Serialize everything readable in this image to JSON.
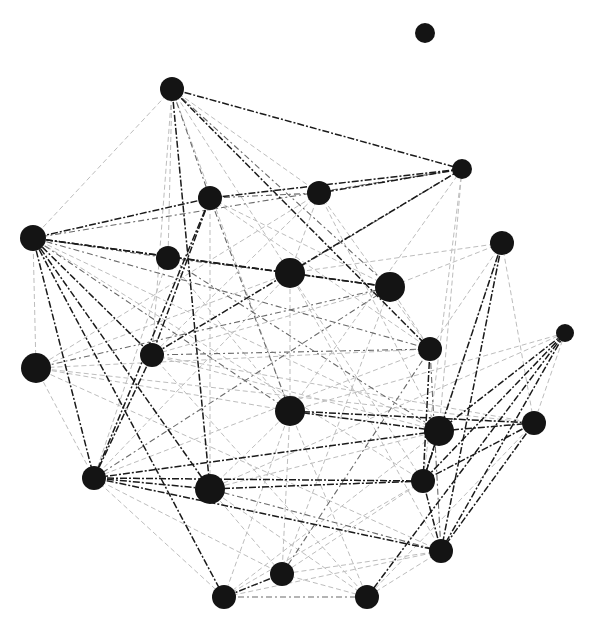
{
  "diagram": {
    "type": "network-graph",
    "background": "#ffffff",
    "node_color": "#141414",
    "edge_colors": {
      "strong": "#1a1a1a",
      "medium": "#6a6a6a",
      "light": "#bdbdbd"
    },
    "nodes": [
      {
        "id": 0,
        "x": 425,
        "y": 33,
        "r": 10
      },
      {
        "id": 1,
        "x": 172,
        "y": 89,
        "r": 12
      },
      {
        "id": 2,
        "x": 462,
        "y": 169,
        "r": 10
      },
      {
        "id": 3,
        "x": 210,
        "y": 198,
        "r": 12
      },
      {
        "id": 4,
        "x": 319,
        "y": 193,
        "r": 12
      },
      {
        "id": 5,
        "x": 33,
        "y": 238,
        "r": 13
      },
      {
        "id": 6,
        "x": 502,
        "y": 243,
        "r": 12
      },
      {
        "id": 7,
        "x": 168,
        "y": 258,
        "r": 12
      },
      {
        "id": 8,
        "x": 290,
        "y": 273,
        "r": 15
      },
      {
        "id": 9,
        "x": 390,
        "y": 287,
        "r": 15
      },
      {
        "id": 10,
        "x": 565,
        "y": 333,
        "r": 9
      },
      {
        "id": 11,
        "x": 430,
        "y": 349,
        "r": 12
      },
      {
        "id": 12,
        "x": 152,
        "y": 355,
        "r": 12
      },
      {
        "id": 13,
        "x": 36,
        "y": 368,
        "r": 15
      },
      {
        "id": 14,
        "x": 290,
        "y": 411,
        "r": 15
      },
      {
        "id": 15,
        "x": 439,
        "y": 431,
        "r": 15
      },
      {
        "id": 16,
        "x": 534,
        "y": 423,
        "r": 12
      },
      {
        "id": 17,
        "x": 94,
        "y": 478,
        "r": 12
      },
      {
        "id": 18,
        "x": 210,
        "y": 489,
        "r": 15
      },
      {
        "id": 19,
        "x": 423,
        "y": 481,
        "r": 12
      },
      {
        "id": 20,
        "x": 441,
        "y": 551,
        "r": 12
      },
      {
        "id": 21,
        "x": 282,
        "y": 574,
        "r": 12
      },
      {
        "id": 22,
        "x": 224,
        "y": 597,
        "r": 12
      },
      {
        "id": 23,
        "x": 367,
        "y": 597,
        "r": 12
      }
    ],
    "edges": [
      {
        "s": 1,
        "t": 2,
        "w": "strong"
      },
      {
        "s": 1,
        "t": 3,
        "w": "medium"
      },
      {
        "s": 1,
        "t": 18,
        "w": "strong"
      },
      {
        "s": 1,
        "t": 11,
        "w": "strong"
      },
      {
        "s": 1,
        "t": 9,
        "w": "medium"
      },
      {
        "s": 1,
        "t": 5,
        "w": "light"
      },
      {
        "s": 1,
        "t": 12,
        "w": "light"
      },
      {
        "s": 1,
        "t": 4,
        "w": "light"
      },
      {
        "s": 1,
        "t": 8,
        "w": "light"
      },
      {
        "s": 1,
        "t": 14,
        "w": "light"
      },
      {
        "s": 1,
        "t": 7,
        "w": "light"
      },
      {
        "s": 2,
        "t": 3,
        "w": "strong"
      },
      {
        "s": 2,
        "t": 4,
        "w": "strong"
      },
      {
        "s": 2,
        "t": 12,
        "w": "strong"
      },
      {
        "s": 2,
        "t": 8,
        "w": "medium"
      },
      {
        "s": 2,
        "t": 5,
        "w": "medium"
      },
      {
        "s": 2,
        "t": 14,
        "w": "light"
      },
      {
        "s": 2,
        "t": 15,
        "w": "light"
      },
      {
        "s": 2,
        "t": 19,
        "w": "light"
      },
      {
        "s": 3,
        "t": 5,
        "w": "strong"
      },
      {
        "s": 3,
        "t": 17,
        "w": "strong"
      },
      {
        "s": 3,
        "t": 14,
        "w": "medium"
      },
      {
        "s": 3,
        "t": 11,
        "w": "light"
      },
      {
        "s": 3,
        "t": 18,
        "w": "light"
      },
      {
        "s": 3,
        "t": 4,
        "w": "medium"
      },
      {
        "s": 3,
        "t": 9,
        "w": "light"
      },
      {
        "s": 4,
        "t": 12,
        "w": "light"
      },
      {
        "s": 4,
        "t": 11,
        "w": "light"
      },
      {
        "s": 4,
        "t": 15,
        "w": "light"
      },
      {
        "s": 4,
        "t": 13,
        "w": "light"
      },
      {
        "s": 5,
        "t": 8,
        "w": "strong"
      },
      {
        "s": 5,
        "t": 9,
        "w": "strong"
      },
      {
        "s": 5,
        "t": 11,
        "w": "medium"
      },
      {
        "s": 5,
        "t": 12,
        "w": "strong"
      },
      {
        "s": 5,
        "t": 17,
        "w": "strong"
      },
      {
        "s": 5,
        "t": 18,
        "w": "strong"
      },
      {
        "s": 5,
        "t": 22,
        "w": "strong"
      },
      {
        "s": 5,
        "t": 14,
        "w": "medium"
      },
      {
        "s": 5,
        "t": 15,
        "w": "light"
      },
      {
        "s": 5,
        "t": 13,
        "w": "light"
      },
      {
        "s": 5,
        "t": 7,
        "w": "medium"
      },
      {
        "s": 5,
        "t": 19,
        "w": "light"
      },
      {
        "s": 6,
        "t": 19,
        "w": "strong"
      },
      {
        "s": 6,
        "t": 20,
        "w": "strong"
      },
      {
        "s": 6,
        "t": 15,
        "w": "light"
      },
      {
        "s": 6,
        "t": 16,
        "w": "light"
      },
      {
        "s": 6,
        "t": 11,
        "w": "light"
      },
      {
        "s": 6,
        "t": 8,
        "w": "light"
      },
      {
        "s": 6,
        "t": 9,
        "w": "light"
      },
      {
        "s": 7,
        "t": 8,
        "w": "medium"
      },
      {
        "s": 7,
        "t": 15,
        "w": "medium"
      },
      {
        "s": 7,
        "t": 17,
        "w": "light"
      },
      {
        "s": 7,
        "t": 14,
        "w": "light"
      },
      {
        "s": 8,
        "t": 9,
        "w": "strong"
      },
      {
        "s": 8,
        "t": 13,
        "w": "light"
      },
      {
        "s": 8,
        "t": 17,
        "w": "light"
      },
      {
        "s": 8,
        "t": 19,
        "w": "light"
      },
      {
        "s": 8,
        "t": 20,
        "w": "light"
      },
      {
        "s": 8,
        "t": 14,
        "w": "light"
      },
      {
        "s": 9,
        "t": 13,
        "w": "medium"
      },
      {
        "s": 9,
        "t": 17,
        "w": "medium"
      },
      {
        "s": 9,
        "t": 12,
        "w": "light"
      },
      {
        "s": 9,
        "t": 21,
        "w": "light"
      },
      {
        "s": 10,
        "t": 15,
        "w": "strong"
      },
      {
        "s": 10,
        "t": 19,
        "w": "strong"
      },
      {
        "s": 10,
        "t": 20,
        "w": "strong"
      },
      {
        "s": 10,
        "t": 23,
        "w": "strong"
      },
      {
        "s": 10,
        "t": 16,
        "w": "light"
      },
      {
        "s": 10,
        "t": 14,
        "w": "light"
      },
      {
        "s": 10,
        "t": 18,
        "w": "light"
      },
      {
        "s": 11,
        "t": 19,
        "w": "strong"
      },
      {
        "s": 11,
        "t": 20,
        "w": "medium"
      },
      {
        "s": 11,
        "t": 12,
        "w": "medium"
      },
      {
        "s": 11,
        "t": 13,
        "w": "light"
      },
      {
        "s": 11,
        "t": 21,
        "w": "medium"
      },
      {
        "s": 11,
        "t": 17,
        "w": "light"
      },
      {
        "s": 12,
        "t": 17,
        "w": "strong"
      },
      {
        "s": 12,
        "t": 15,
        "w": "light"
      },
      {
        "s": 12,
        "t": 23,
        "w": "light"
      },
      {
        "s": 12,
        "t": 16,
        "w": "light"
      },
      {
        "s": 13,
        "t": 14,
        "w": "light"
      },
      {
        "s": 13,
        "t": 16,
        "w": "light"
      },
      {
        "s": 13,
        "t": 17,
        "w": "light"
      },
      {
        "s": 13,
        "t": 20,
        "w": "light"
      },
      {
        "s": 14,
        "t": 15,
        "w": "strong"
      },
      {
        "s": 14,
        "t": 16,
        "w": "strong"
      },
      {
        "s": 14,
        "t": 23,
        "w": "light"
      },
      {
        "s": 14,
        "t": 21,
        "w": "light"
      },
      {
        "s": 14,
        "t": 18,
        "w": "light"
      },
      {
        "s": 14,
        "t": 22,
        "w": "light"
      },
      {
        "s": 15,
        "t": 16,
        "w": "strong"
      },
      {
        "s": 15,
        "t": 17,
        "w": "strong"
      },
      {
        "s": 15,
        "t": 19,
        "w": "strong"
      },
      {
        "s": 15,
        "t": 18,
        "w": "light"
      },
      {
        "s": 15,
        "t": 22,
        "w": "light"
      },
      {
        "s": 16,
        "t": 19,
        "w": "strong"
      },
      {
        "s": 16,
        "t": 20,
        "w": "strong"
      },
      {
        "s": 16,
        "t": 23,
        "w": "light"
      },
      {
        "s": 17,
        "t": 18,
        "w": "strong"
      },
      {
        "s": 17,
        "t": 19,
        "w": "strong"
      },
      {
        "s": 17,
        "t": 20,
        "w": "strong"
      },
      {
        "s": 17,
        "t": 22,
        "w": "light"
      },
      {
        "s": 17,
        "t": 21,
        "w": "light"
      },
      {
        "s": 18,
        "t": 19,
        "w": "strong"
      },
      {
        "s": 18,
        "t": 20,
        "w": "medium"
      },
      {
        "s": 18,
        "t": 21,
        "w": "light"
      },
      {
        "s": 18,
        "t": 23,
        "w": "light"
      },
      {
        "s": 19,
        "t": 20,
        "w": "strong"
      },
      {
        "s": 19,
        "t": 22,
        "w": "light"
      },
      {
        "s": 19,
        "t": 21,
        "w": "light"
      },
      {
        "s": 20,
        "t": 23,
        "w": "light"
      },
      {
        "s": 20,
        "t": 21,
        "w": "light"
      },
      {
        "s": 20,
        "t": 22,
        "w": "light"
      },
      {
        "s": 21,
        "t": 22,
        "w": "strong"
      },
      {
        "s": 21,
        "t": 23,
        "w": "light"
      },
      {
        "s": 22,
        "t": 23,
        "w": "medium"
      },
      {
        "s": 3,
        "t": 12,
        "w": "strong"
      },
      {
        "s": 4,
        "t": 8,
        "w": "light"
      },
      {
        "s": 9,
        "t": 11,
        "w": "light"
      }
    ]
  }
}
